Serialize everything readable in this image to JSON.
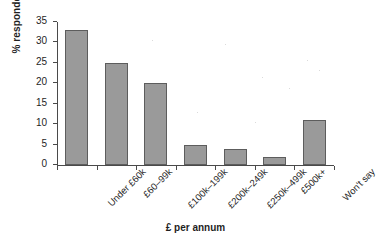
{
  "chart_data": {
    "type": "bar",
    "title": "",
    "xlabel": "£ per annum",
    "ylabel": "% respondents",
    "categories": [
      "Under £60k",
      "£60–99k",
      "£100k–199k",
      "£200k–249k",
      "£250k–499k",
      "£500k+",
      "Won't say"
    ],
    "values": [
      33,
      25,
      20,
      5,
      4,
      2,
      11
    ],
    "ylim": [
      0,
      35
    ],
    "ytick_labels": [
      "0",
      "5",
      "10",
      "15",
      "20",
      "25",
      "30",
      "35"
    ],
    "ytick_values": [
      0,
      5,
      10,
      15,
      20,
      25,
      30,
      35
    ],
    "grid": false,
    "legend": false,
    "bar_color": "#9a9a9a",
    "bar_edge_color": "#5d5d5d",
    "axis_color": "#4a4a4a"
  }
}
